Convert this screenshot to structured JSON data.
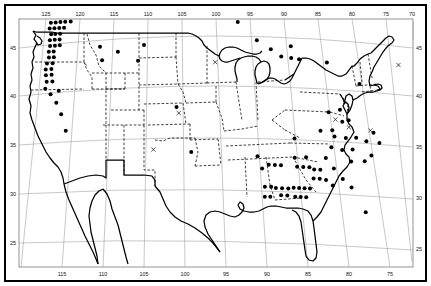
{
  "figure": {
    "kind": "species-distribution-map",
    "region": "Continental United States",
    "background_color": "#ffffff",
    "ink_color": "#000000",
    "graticule_color": "#8a8a8a"
  },
  "axes": {
    "longitude_top": [
      "125",
      "120",
      "115",
      "110",
      "105",
      "100",
      "95",
      "90",
      "85",
      "80",
      "75",
      "70"
    ],
    "longitude_bottom": [
      "115",
      "110",
      "105",
      "100",
      "95",
      "90",
      "85",
      "80",
      "75"
    ],
    "latitude_left": [
      "45",
      "40",
      "35",
      "30",
      "25"
    ],
    "latitude_right": [
      "45",
      "40",
      "35",
      "30",
      "25"
    ]
  },
  "legend": {
    "filled_circle_meaning": "occurrence record",
    "cross_meaning": "unconfirmed record"
  },
  "chart_data": {
    "type": "scatter",
    "title": "",
    "xlabel": "",
    "ylabel": "",
    "xlim": [
      -127.5,
      -66.5
    ],
    "ylim": [
      23.0,
      49.8
    ],
    "grid": true,
    "legend_position": "none",
    "series": [
      {
        "name": "occurrence",
        "marker": "filled-circle",
        "points": [
          [
            -124.4,
            48.4
          ],
          [
            -123.6,
            48.5
          ],
          [
            -122.9,
            48.6
          ],
          [
            -122.2,
            48.6
          ],
          [
            -121.4,
            48.6
          ],
          [
            -120.6,
            48.6
          ],
          [
            -119.8,
            48.6
          ],
          [
            -124.0,
            48.0
          ],
          [
            -123.3,
            48.0
          ],
          [
            -122.6,
            48.0
          ],
          [
            -121.9,
            48.0
          ],
          [
            -121.1,
            48.0
          ],
          [
            -120.3,
            48.0
          ],
          [
            -119.5,
            48.0
          ],
          [
            -118.6,
            48.0
          ],
          [
            -124.2,
            47.4
          ],
          [
            -123.5,
            47.4
          ],
          [
            -122.8,
            47.4
          ],
          [
            -122.1,
            47.4
          ],
          [
            -121.3,
            47.4
          ],
          [
            -124.3,
            46.8
          ],
          [
            -123.6,
            46.8
          ],
          [
            -122.9,
            46.8
          ],
          [
            -122.2,
            46.8
          ],
          [
            -124.0,
            46.2
          ],
          [
            -123.4,
            46.2
          ],
          [
            -122.7,
            46.2
          ],
          [
            -124.1,
            45.6
          ],
          [
            -123.4,
            45.6
          ],
          [
            -122.7,
            45.6
          ],
          [
            -124.0,
            45.0
          ],
          [
            -123.3,
            45.0
          ],
          [
            -122.6,
            45.0
          ],
          [
            -124.1,
            44.4
          ],
          [
            -123.4,
            44.4
          ],
          [
            -124.0,
            43.8
          ],
          [
            -123.3,
            43.8
          ],
          [
            -124.2,
            43.2
          ],
          [
            -123.4,
            43.2
          ],
          [
            -124.3,
            42.6
          ],
          [
            -123.5,
            42.6
          ],
          [
            -124.2,
            42.0
          ],
          [
            -123.4,
            42.0
          ],
          [
            -124.0,
            41.3
          ],
          [
            -123.2,
            41.3
          ],
          [
            -124.1,
            40.6
          ],
          [
            -123.3,
            40.0
          ],
          [
            -122.2,
            40.3
          ],
          [
            -122.4,
            39.1
          ],
          [
            -121.6,
            37.9
          ],
          [
            -120.8,
            36.2
          ],
          [
            -116.8,
            44.6
          ],
          [
            -116.4,
            43.2
          ],
          [
            -114.2,
            44.0
          ],
          [
            -111.3,
            43.0
          ],
          [
            -110.5,
            44.6
          ],
          [
            -105.9,
            38.2
          ],
          [
            -104.0,
            33.7
          ],
          [
            -96.9,
            46.8
          ],
          [
            -94.3,
            45.0
          ],
          [
            -92.4,
            44.1
          ],
          [
            -91.0,
            43.4
          ],
          [
            -89.6,
            43.3
          ],
          [
            -88.5,
            43.2
          ],
          [
            -89.5,
            44.5
          ],
          [
            -84.6,
            43.0
          ],
          [
            -80.4,
            41.0
          ],
          [
            -68.8,
            45.4
          ],
          [
            -90.2,
            35.2
          ],
          [
            -90.4,
            33.3
          ],
          [
            -88.9,
            33.4
          ],
          [
            -90.2,
            32.4
          ],
          [
            -89.4,
            32.4
          ],
          [
            -88.6,
            32.4
          ],
          [
            -93.9,
            32.5
          ],
          [
            -93.1,
            32.5
          ],
          [
            -92.3,
            32.5
          ],
          [
            -95.3,
            33.3
          ],
          [
            -94.8,
            32.1
          ],
          [
            -94.6,
            30.3
          ],
          [
            -93.8,
            30.3
          ],
          [
            -93.2,
            30.2
          ],
          [
            -92.4,
            30.2
          ],
          [
            -91.6,
            30.2
          ],
          [
            -90.9,
            30.3
          ],
          [
            -90.2,
            30.3
          ],
          [
            -89.5,
            30.3
          ],
          [
            -88.8,
            30.3
          ],
          [
            -92.6,
            29.5
          ],
          [
            -91.8,
            29.5
          ],
          [
            -90.8,
            29.4
          ],
          [
            -90.1,
            29.4
          ],
          [
            -89.4,
            29.4
          ],
          [
            -94.7,
            29.3
          ],
          [
            -94.0,
            29.3
          ],
          [
            -88.2,
            31.3
          ],
          [
            -87.4,
            31.3
          ],
          [
            -88.0,
            32.2
          ],
          [
            -87.2,
            32.2
          ],
          [
            -86.6,
            31.2
          ],
          [
            -85.8,
            30.7
          ],
          [
            -86.3,
            33.4
          ],
          [
            -85.4,
            32.4
          ],
          [
            -84.4,
            31.4
          ],
          [
            -83.4,
            30.6
          ],
          [
            -82.0,
            28.2
          ],
          [
            -85.4,
            34.5
          ],
          [
            -84.0,
            34.3
          ],
          [
            -82.6,
            34.4
          ],
          [
            -84.8,
            35.6
          ],
          [
            -83.3,
            35.5
          ],
          [
            -81.9,
            35.6
          ],
          [
            -80.6,
            35.3
          ],
          [
            -80.2,
            33.9
          ],
          [
            -81.2,
            33.3
          ],
          [
            -83.0,
            33.2
          ],
          [
            -86.6,
            36.1
          ],
          [
            -85.0,
            36.2
          ],
          [
            -83.5,
            37.1
          ],
          [
            -85.2,
            38.0
          ],
          [
            -83.6,
            38.3
          ],
          [
            -82.6,
            37.3
          ],
          [
            -79.3,
            36.2
          ],
          [
            -78.5,
            35.2
          ]
        ]
      },
      {
        "name": "unconfirmed",
        "marker": "cross",
        "points": [
          [
            -100.4,
            42.7
          ],
          [
            -105.6,
            37.6
          ],
          [
            -109.0,
            34.0
          ],
          [
            -84.4,
            37.3
          ],
          [
            -82.7,
            36.6
          ],
          [
            -79.8,
            36.4
          ],
          [
            -73.8,
            43.2
          ]
        ]
      }
    ]
  }
}
